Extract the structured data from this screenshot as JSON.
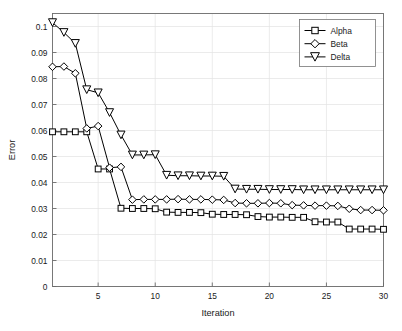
{
  "chart_data": {
    "type": "line",
    "title": "",
    "xlabel": "Iteration",
    "ylabel": "Error",
    "xlim": [
      1,
      30
    ],
    "ylim": [
      0,
      0.105
    ],
    "grid": true,
    "legend_position": "top-right",
    "xticks": [
      5,
      10,
      15,
      20,
      25,
      30
    ],
    "xtick_labels": [
      "5",
      "10",
      "15",
      "20",
      "25",
      "30"
    ],
    "yticks": [
      0,
      0.01,
      0.02,
      0.03,
      0.04,
      0.05,
      0.06,
      0.07,
      0.08,
      0.09,
      0.1
    ],
    "ytick_labels": [
      "0",
      "0.01",
      "0.02",
      "0.03",
      "0.04",
      "0.05",
      "0.06",
      "0.07",
      "0.08",
      "0.09",
      "0.1"
    ],
    "x": [
      1,
      2,
      3,
      4,
      5,
      6,
      7,
      8,
      9,
      10,
      11,
      12,
      13,
      14,
      15,
      16,
      17,
      18,
      19,
      20,
      21,
      22,
      23,
      24,
      25,
      26,
      27,
      28,
      29,
      30
    ],
    "series": [
      {
        "name": "Alpha",
        "marker": "square",
        "color": "#000000",
        "values": [
          0.0595,
          0.0595,
          0.0595,
          0.0595,
          0.0452,
          0.0452,
          0.0301,
          0.03,
          0.03,
          0.0299,
          0.0286,
          0.0285,
          0.0285,
          0.0284,
          0.0278,
          0.0277,
          0.0277,
          0.0276,
          0.0269,
          0.0267,
          0.0267,
          0.0266,
          0.0266,
          0.0249,
          0.0248,
          0.0248,
          0.0221,
          0.0221,
          0.0221,
          0.022
        ]
      },
      {
        "name": "Beta",
        "marker": "diamond",
        "color": "#000000",
        "values": [
          0.0845,
          0.0846,
          0.082,
          0.0608,
          0.0617,
          0.0457,
          0.046,
          0.0334,
          0.0335,
          0.0335,
          0.0335,
          0.0336,
          0.0335,
          0.0335,
          0.0334,
          0.0333,
          0.0321,
          0.032,
          0.032,
          0.0321,
          0.032,
          0.0313,
          0.0312,
          0.0311,
          0.0311,
          0.031,
          0.0299,
          0.0294,
          0.0294,
          0.0293
        ]
      },
      {
        "name": "Delta",
        "marker": "triangle-down",
        "color": "#000000",
        "values": [
          0.1015,
          0.0977,
          0.0935,
          0.0757,
          0.0745,
          0.0669,
          0.0583,
          0.0506,
          0.0506,
          0.0507,
          0.0428,
          0.0426,
          0.0426,
          0.0425,
          0.0425,
          0.0424,
          0.0375,
          0.0374,
          0.0374,
          0.0373,
          0.0373,
          0.0373,
          0.0372,
          0.0372,
          0.0372,
          0.0372,
          0.0372,
          0.0372,
          0.0372,
          0.0372
        ]
      }
    ]
  },
  "legend": {
    "entries": [
      {
        "label": "Alpha",
        "marker": "square"
      },
      {
        "label": "Beta",
        "marker": "diamond"
      },
      {
        "label": "Delta",
        "marker": "triangle-down"
      }
    ]
  }
}
